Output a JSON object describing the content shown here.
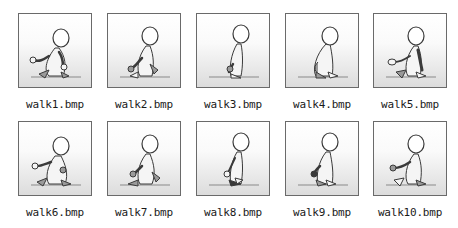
{
  "figure": {
    "frames": [
      {
        "file": "walk1.bmp",
        "pose": 1
      },
      {
        "file": "walk2.bmp",
        "pose": 2
      },
      {
        "file": "walk3.bmp",
        "pose": 3
      },
      {
        "file": "walk4.bmp",
        "pose": 4
      },
      {
        "file": "walk5.bmp",
        "pose": 5
      },
      {
        "file": "walk6.bmp",
        "pose": 6
      },
      {
        "file": "walk7.bmp",
        "pose": 7
      },
      {
        "file": "walk8.bmp",
        "pose": 8
      },
      {
        "file": "walk9.bmp",
        "pose": 9
      },
      {
        "file": "walk10.bmp",
        "pose": 10
      }
    ],
    "colors": {
      "frame_border": "#6a6a6a",
      "figure_fill": "#f5f5f5",
      "figure_shade": "#9a9a9a",
      "outline": "#3a3a3a",
      "ground": "#8a8a8a"
    }
  }
}
